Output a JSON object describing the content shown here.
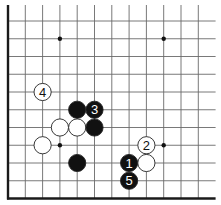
{
  "diagram": {
    "title": "",
    "type": "go-board-corner",
    "grid": {
      "columns": 12,
      "rows": 10,
      "origin_x": 8,
      "origin_y": 21,
      "col_spacing": 17.3,
      "row_spacing": 17.75,
      "edges": [
        "left",
        "bottom"
      ],
      "line_color": "#6a6a6a",
      "edge_color": "#1a1a1a"
    },
    "star_points": [
      {
        "col": 3,
        "row": 1
      },
      {
        "col": 9,
        "row": 1
      },
      {
        "col": 3,
        "row": 7
      },
      {
        "col": 9,
        "row": 7
      }
    ],
    "stones": [
      {
        "color": "white",
        "col": 2,
        "row": 4,
        "label": "4"
      },
      {
        "color": "black",
        "col": 4,
        "row": 5,
        "label": ""
      },
      {
        "color": "black",
        "col": 5,
        "row": 5,
        "label": "3"
      },
      {
        "color": "white",
        "col": 3,
        "row": 6,
        "label": ""
      },
      {
        "color": "white",
        "col": 4,
        "row": 6,
        "label": ""
      },
      {
        "color": "black",
        "col": 5,
        "row": 6,
        "label": ""
      },
      {
        "color": "white",
        "col": 2,
        "row": 7,
        "label": ""
      },
      {
        "color": "black",
        "col": 4,
        "row": 8,
        "label": ""
      },
      {
        "color": "white",
        "col": 8,
        "row": 7,
        "label": "2"
      },
      {
        "color": "black",
        "col": 7,
        "row": 8,
        "label": "1"
      },
      {
        "color": "white",
        "col": 8,
        "row": 8,
        "label": ""
      },
      {
        "color": "black",
        "col": 7,
        "row": 9,
        "label": "5"
      }
    ],
    "colors": {
      "black_stone": "#111111",
      "white_stone": "#ffffff",
      "stone_outline": "#222222",
      "background": "#ffffff"
    }
  }
}
